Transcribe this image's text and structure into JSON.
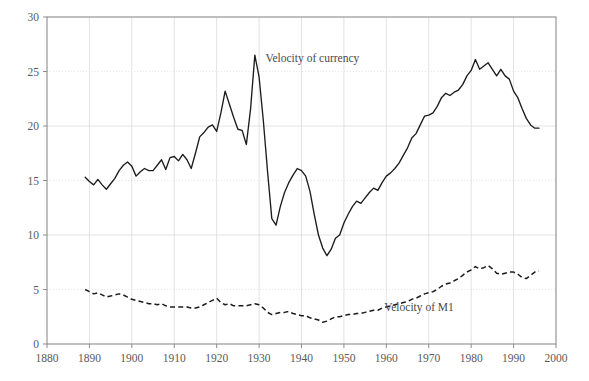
{
  "chart_data": {
    "type": "line",
    "title": "",
    "subtitle": "",
    "xlabel": "",
    "ylabel": "",
    "xlim": [
      1880,
      2000
    ],
    "ylim": [
      0,
      30
    ],
    "xticks": [
      1880,
      1890,
      1900,
      1910,
      1920,
      1930,
      1940,
      1950,
      1960,
      1970,
      1980,
      1990,
      2000
    ],
    "yticks": [
      0,
      5,
      10,
      15,
      20,
      25,
      30
    ],
    "xtick_labels": [
      "1880",
      "1890",
      "1900",
      "1910",
      "1920",
      "1930",
      "1940",
      "1950",
      "1960",
      "1970",
      "1980",
      "1990",
      "2000"
    ],
    "ytick_labels": [
      "0",
      "5",
      "10",
      "15",
      "20",
      "25",
      "30"
    ],
    "grid": true,
    "legend": "inline-annotations",
    "annotations": [
      {
        "text": "Velocity of currency",
        "x": 1931.5,
        "y": 26.2,
        "anchor": "start"
      },
      {
        "text": "Velocity of M1",
        "x": 1959.5,
        "y": 3.35,
        "anchor": "start"
      }
    ],
    "series": [
      {
        "name": "Velocity of currency",
        "style": "solid",
        "color": "#1c1c1c",
        "x": [
          1889,
          1890,
          1891,
          1892,
          1893,
          1894,
          1895,
          1896,
          1897,
          1898,
          1899,
          1900,
          1901,
          1902,
          1903,
          1904,
          1905,
          1906,
          1907,
          1908,
          1909,
          1910,
          1911,
          1912,
          1913,
          1914,
          1915,
          1916,
          1917,
          1918,
          1919,
          1920,
          1921,
          1922,
          1923,
          1924,
          1925,
          1926,
          1927,
          1928,
          1929,
          1930,
          1931,
          1932,
          1933,
          1934,
          1935,
          1936,
          1937,
          1938,
          1939,
          1940,
          1941,
          1942,
          1943,
          1944,
          1945,
          1946,
          1947,
          1948,
          1949,
          1950,
          1951,
          1952,
          1953,
          1954,
          1955,
          1956,
          1957,
          1958,
          1959,
          1960,
          1961,
          1962,
          1963,
          1964,
          1965,
          1966,
          1967,
          1968,
          1969,
          1970,
          1971,
          1972,
          1973,
          1974,
          1975,
          1976,
          1977,
          1978,
          1979,
          1980,
          1981,
          1982,
          1983,
          1984,
          1985,
          1986,
          1987,
          1988,
          1989,
          1990,
          1991,
          1992,
          1993,
          1994,
          1995,
          1996
        ],
        "y": [
          15.3,
          14.9,
          14.6,
          15.1,
          14.6,
          14.2,
          14.7,
          15.2,
          15.9,
          16.4,
          16.7,
          16.3,
          15.4,
          15.8,
          16.1,
          15.9,
          15.9,
          16.4,
          16.9,
          16.0,
          17.1,
          17.2,
          16.8,
          17.4,
          16.9,
          16.1,
          17.5,
          19.0,
          19.4,
          19.9,
          20.1,
          19.5,
          21.2,
          23.2,
          22.0,
          20.8,
          19.7,
          19.6,
          18.3,
          21.6,
          26.5,
          24.5,
          20.5,
          15.8,
          11.5,
          10.9,
          12.6,
          13.9,
          14.8,
          15.5,
          16.1,
          15.9,
          15.4,
          14.0,
          11.9,
          10.0,
          8.8,
          8.1,
          8.7,
          9.7,
          10.0,
          11.1,
          11.9,
          12.6,
          13.1,
          12.9,
          13.4,
          13.9,
          14.3,
          14.1,
          14.8,
          15.4,
          15.7,
          16.1,
          16.6,
          17.3,
          18.0,
          18.9,
          19.3,
          20.1,
          20.9,
          21.0,
          21.2,
          21.8,
          22.6,
          23.0,
          22.8,
          23.1,
          23.3,
          23.8,
          24.6,
          25.1,
          26.1,
          25.2,
          25.5,
          25.8,
          25.2,
          24.6,
          25.2,
          24.6,
          24.3,
          23.2,
          22.6,
          21.6,
          20.7,
          20.1,
          19.8,
          19.8
        ]
      },
      {
        "name": "Velocity of M1",
        "style": "dashed",
        "color": "#1c1c1c",
        "x": [
          1889,
          1890,
          1891,
          1892,
          1893,
          1894,
          1895,
          1896,
          1897,
          1898,
          1899,
          1900,
          1901,
          1902,
          1903,
          1904,
          1905,
          1906,
          1907,
          1908,
          1909,
          1910,
          1911,
          1912,
          1913,
          1914,
          1915,
          1916,
          1917,
          1918,
          1919,
          1920,
          1921,
          1922,
          1923,
          1924,
          1925,
          1926,
          1927,
          1928,
          1929,
          1930,
          1931,
          1932,
          1933,
          1934,
          1935,
          1936,
          1937,
          1938,
          1939,
          1940,
          1941,
          1942,
          1943,
          1944,
          1945,
          1946,
          1947,
          1948,
          1949,
          1950,
          1951,
          1952,
          1953,
          1954,
          1955,
          1956,
          1957,
          1958,
          1959,
          1960,
          1961,
          1962,
          1963,
          1964,
          1965,
          1966,
          1967,
          1968,
          1969,
          1970,
          1971,
          1972,
          1973,
          1974,
          1975,
          1976,
          1977,
          1978,
          1979,
          1980,
          1981,
          1982,
          1983,
          1984,
          1985,
          1986,
          1987,
          1988,
          1989,
          1990,
          1991,
          1992,
          1993,
          1994,
          1995,
          1996
        ],
        "y": [
          5.0,
          4.8,
          4.6,
          4.7,
          4.5,
          4.3,
          4.4,
          4.5,
          4.6,
          4.5,
          4.3,
          4.1,
          4.0,
          3.9,
          3.8,
          3.7,
          3.7,
          3.6,
          3.7,
          3.5,
          3.4,
          3.4,
          3.4,
          3.4,
          3.4,
          3.3,
          3.3,
          3.4,
          3.6,
          3.8,
          4.0,
          4.2,
          3.8,
          3.6,
          3.7,
          3.5,
          3.5,
          3.5,
          3.5,
          3.6,
          3.7,
          3.6,
          3.3,
          2.9,
          2.7,
          2.8,
          2.9,
          2.9,
          3.0,
          2.8,
          2.7,
          2.6,
          2.6,
          2.4,
          2.3,
          2.2,
          2.0,
          2.1,
          2.3,
          2.5,
          2.5,
          2.6,
          2.7,
          2.7,
          2.8,
          2.8,
          2.9,
          3.0,
          3.1,
          3.1,
          3.3,
          3.4,
          3.5,
          3.6,
          3.7,
          3.8,
          3.9,
          4.1,
          4.2,
          4.4,
          4.6,
          4.7,
          4.8,
          5.0,
          5.3,
          5.5,
          5.6,
          5.8,
          6.0,
          6.3,
          6.6,
          6.8,
          7.1,
          6.9,
          7.0,
          7.2,
          6.9,
          6.5,
          6.4,
          6.5,
          6.6,
          6.6,
          6.4,
          6.1,
          6.0,
          6.3,
          6.6,
          6.7
        ]
      }
    ]
  },
  "plot": {
    "left_px": 47,
    "right_px": 556,
    "top_px": 17,
    "bottom_px": 344
  }
}
